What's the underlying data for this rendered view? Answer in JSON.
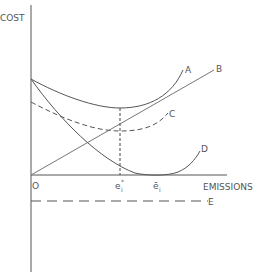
{
  "diagram": {
    "title": "",
    "y_axis_label": "COST",
    "x_axis_label": "EMISSIONS",
    "origin_label": "O",
    "x_ticks": [
      {
        "label": "e",
        "sup": "*",
        "sub": "i",
        "name": "optimal-emissions"
      },
      {
        "label": "ē",
        "sub": "i",
        "name": "unregulated-emissions"
      }
    ],
    "curves": [
      {
        "id": "A",
        "label": "A",
        "style": "solid",
        "description": "total cost curve (U-shaped)"
      },
      {
        "id": "B",
        "label": "B",
        "style": "solid",
        "description": "rising straight line from origin"
      },
      {
        "id": "C",
        "label": "C",
        "style": "dashed",
        "description": "lower U-shaped dashed curve"
      },
      {
        "id": "D",
        "label": "D",
        "style": "solid",
        "description": "decreasing convex curve reaching zero at ē_i"
      },
      {
        "id": "E",
        "label": "E",
        "style": "dashed",
        "description": "horizontal dashed line below axis"
      }
    ],
    "colors": {
      "line": "#555555",
      "background": "#ffffff"
    }
  }
}
